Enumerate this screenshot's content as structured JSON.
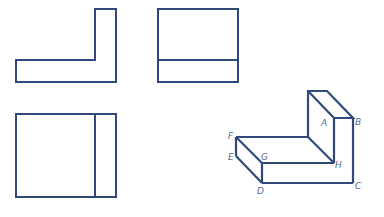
{
  "diagram": {
    "type": "orthographic-projection",
    "stroke_color": "#2f4a7a",
    "label_color": "#5a6a8a",
    "views": [
      {
        "name": "front-view",
        "description": "L-shape"
      },
      {
        "name": "side-view",
        "description": "rectangle divided horizontally"
      },
      {
        "name": "top-view",
        "description": "rectangle divided vertically"
      },
      {
        "name": "isometric-view",
        "description": "L-shaped solid"
      }
    ],
    "labels": {
      "A": "A",
      "B": "B",
      "C": "C",
      "D": "D",
      "E": "E",
      "F": "F",
      "G": "G",
      "H": "H"
    }
  }
}
